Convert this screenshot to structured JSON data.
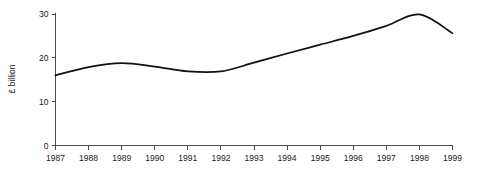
{
  "chart_data": {
    "type": "line",
    "title": "",
    "subtitle": "",
    "xlabel": "",
    "ylabel": "£ billion",
    "x": [
      1987,
      1988,
      1989,
      1990,
      1991,
      1992,
      1993,
      1994,
      1995,
      1996,
      1997,
      1998,
      1999
    ],
    "categories": [
      "1987",
      "1988",
      "1989",
      "1990",
      "1991",
      "1992",
      "1993",
      "1994",
      "1995",
      "1996",
      "1997",
      "1998",
      "1999"
    ],
    "values": [
      16.0,
      17.9,
      18.8,
      18.0,
      16.9,
      16.9,
      18.9,
      21.0,
      23.0,
      25.0,
      27.3,
      29.9,
      25.6
    ],
    "series": [
      {
        "name": "£ billion",
        "values": [
          16.0,
          17.9,
          18.8,
          18.0,
          16.9,
          16.9,
          18.9,
          21.0,
          23.0,
          25.0,
          27.3,
          29.9,
          25.6
        ]
      }
    ],
    "xlim": [
      1987,
      1999
    ],
    "ylim": [
      0,
      30
    ],
    "yticks": [
      0,
      10,
      20,
      30
    ],
    "ytick_labels": [
      "0",
      "10",
      "20",
      "30"
    ],
    "xticks": [
      1987,
      1988,
      1989,
      1990,
      1991,
      1992,
      1993,
      1994,
      1995,
      1996,
      1997,
      1998,
      1999
    ],
    "xtick_labels": [
      "1987",
      "1988",
      "1989",
      "1990",
      "1991",
      "1992",
      "1993",
      "1994",
      "1995",
      "1996",
      "1997",
      "1998",
      "1999"
    ],
    "grid": false,
    "legend": false,
    "legend_position": "none",
    "annotations": [],
    "line_color": "#111111",
    "axis_color": "#4a4a4a",
    "background_color": "#ffffff",
    "notes": {
      "local_peak_year": "1989",
      "local_peak_value": 18.8,
      "trough_value": 16.7,
      "max_value": 29.9,
      "max_year": "1998",
      "start_value": 16.0,
      "end_value": 25.6
    }
  }
}
